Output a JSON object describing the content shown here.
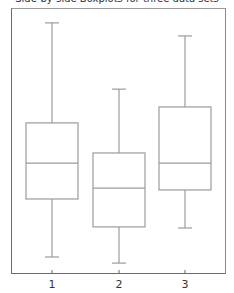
{
  "chart_data": {
    "type": "boxplot",
    "title": "Side-by-side Boxplots for three data sets",
    "xlabel": "",
    "ylabel": "",
    "categories": [
      "1",
      "2",
      "3"
    ],
    "ylim": [
      0,
      100
    ],
    "grid": false,
    "legend": null,
    "series": [
      {
        "name": "1",
        "whisker_low": 6.4,
        "q1": 28.2,
        "median": 41.7,
        "q3": 56.8,
        "whisker_high": 94.4
      },
      {
        "name": "2",
        "whisker_low": 4.1,
        "q1": 17.7,
        "median": 32.3,
        "q3": 45.5,
        "whisker_high": 69.5
      },
      {
        "name": "3",
        "whisker_low": 17.3,
        "q1": 31.6,
        "median": 41.7,
        "q3": 62.8,
        "whisker_high": 89.5
      }
    ],
    "colors": {
      "box_line": "#9b9b9b",
      "frame": "#6b6b6b",
      "text": "#333333"
    }
  }
}
